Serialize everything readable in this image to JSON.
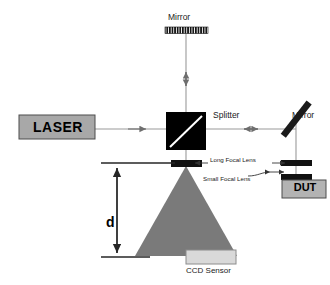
{
  "figure": {
    "type": "optical-interferometer-schematic",
    "background_color": "#ffffff",
    "width": 330,
    "height": 285
  },
  "labels": {
    "mirror_top": "Mirror",
    "mirror_right": "Mirror",
    "splitter": "Splitter",
    "laser": "LASER",
    "long_focal_lens": "Long Focal Lens",
    "small_focal_lens": "Small Focal Lens",
    "dut": "DUT",
    "ccd_sensor": "CCD Sensor",
    "distance": "d"
  },
  "components": {
    "laser_source": {
      "name": "LASER",
      "fill": "#a8a8a8",
      "stroke": "#4d4d4d"
    },
    "beam_splitter": {
      "name": "Splitter",
      "fill": "#000000",
      "diagonal_line_color": "#ffffff"
    },
    "mirror_top": {
      "name": "Mirror",
      "style": "hatched-bar",
      "fill": "#111111",
      "orientation": "horizontal"
    },
    "mirror_right": {
      "name": "Mirror",
      "style": "tilted-bar",
      "fill": "#1a1a1a",
      "angle_deg": 45
    },
    "long_focal_lens": {
      "name": "Long Focal Lens",
      "fill": "#111111"
    },
    "small_focal_lens": {
      "name": "Small Focal Lens",
      "fill": "#111111"
    },
    "device_under_test": {
      "name": "DUT",
      "fill": "#b3b3b3",
      "stroke": "#4d4d4d"
    },
    "ccd_sensor": {
      "name": "CCD Sensor",
      "fill": "#d9d9d9",
      "stroke": "#8c8c8c"
    },
    "beam_cone": {
      "name": "expanding-beam",
      "fill": "#7a7a7a",
      "shape": "triangle"
    }
  },
  "beam_paths": {
    "line_color": "#9a9a9a",
    "arrow_color": "#6e6e6e",
    "paths": [
      {
        "id": "laser-to-splitter",
        "direction": "right",
        "arrowheads": "double"
      },
      {
        "id": "splitter-to-top-mirror",
        "direction": "vertical",
        "arrowheads": "double"
      },
      {
        "id": "splitter-to-right-mirror",
        "direction": "horizontal",
        "arrowheads": "double"
      },
      {
        "id": "right-mirror-to-dut",
        "direction": "vertical",
        "arrowheads": "none"
      },
      {
        "id": "splitter-to-ccd",
        "direction": "down",
        "arrowheads": "none"
      }
    ]
  },
  "dimension": {
    "label": "d",
    "arrow_style": "double-headed",
    "orientation": "vertical",
    "color": "#262626"
  }
}
